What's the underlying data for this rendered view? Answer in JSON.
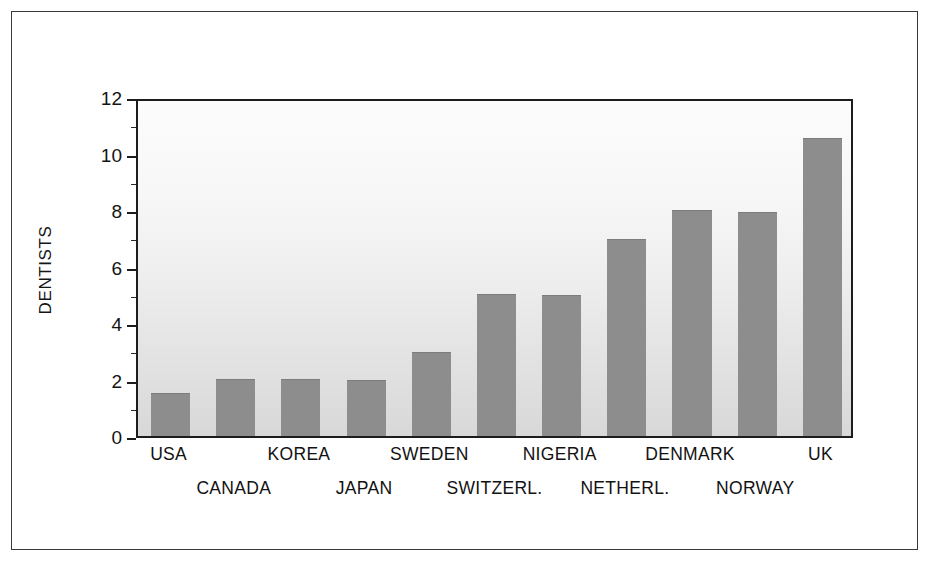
{
  "chart_data": {
    "type": "bar",
    "title": "",
    "subtitle": "",
    "xlabel": "",
    "ylabel": "DENTISTS",
    "ylim": [
      0,
      12
    ],
    "ytick_labels": [
      "0",
      "2",
      "4",
      "6",
      "8",
      "10",
      "12"
    ],
    "ytick_values": [
      0,
      2,
      4,
      6,
      8,
      10,
      12
    ],
    "yminor_values": [
      1,
      3,
      5,
      7,
      9,
      11
    ],
    "grid": false,
    "legend": null,
    "categories": [
      "USA",
      "CANADA",
      "KOREA",
      "JAPAN",
      "SWEDEN",
      "SWITZERL.",
      "NIGERIA",
      "NETHERL.",
      "DENMARK",
      "NORWAY",
      "UK"
    ],
    "values": [
      1.5,
      2.0,
      2.0,
      1.95,
      2.95,
      5.0,
      4.95,
      6.95,
      7.95,
      7.9,
      10.5
    ],
    "bar_color": "#8d8d8d",
    "axis_color": "#1d1d1d",
    "plot_background": "#ededed"
  },
  "figure": {
    "background_color": "#ffffff",
    "border_color": "#3a3a3a"
  }
}
